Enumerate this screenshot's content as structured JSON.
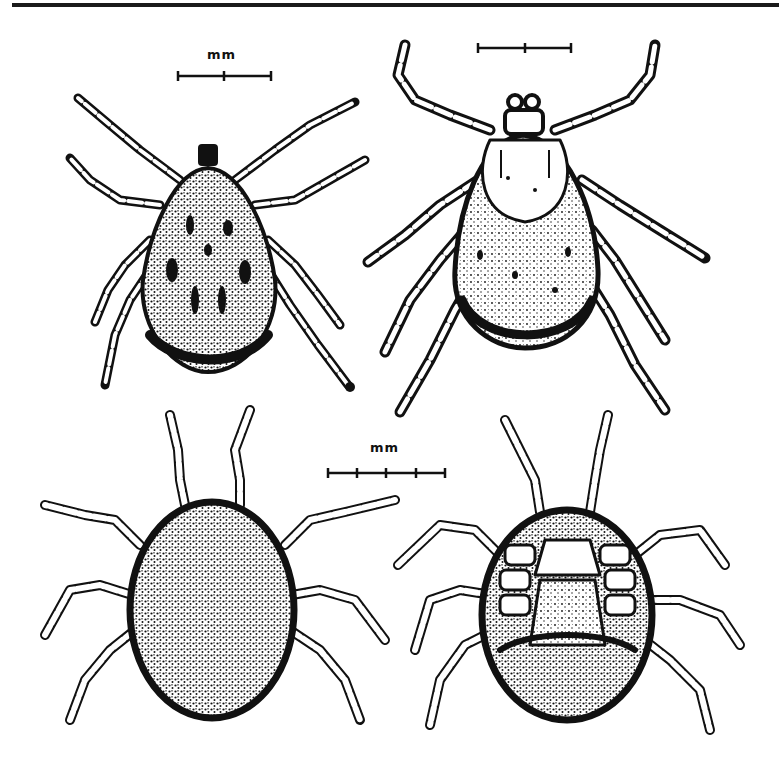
{
  "figure": {
    "type": "scientific-illustration-plate",
    "style": "black ink line drawing on white",
    "colors": {
      "ink": "#111111",
      "paper": "#ffffff",
      "rule": "#1a1a1a"
    },
    "panels": [
      {
        "id": "top-left",
        "subject": "hard tick, dorsal view (male, ornate scutum)",
        "legs": 8
      },
      {
        "id": "top-right",
        "subject": "hard tick, dorsal view (engorged female with scutum)",
        "legs": 8
      },
      {
        "id": "bottom-left",
        "subject": "soft tick, dorsal view (granulated oval body)",
        "legs": 8
      },
      {
        "id": "bottom-right",
        "subject": "soft tick, ventral view (coxae and mouthparts visible)",
        "legs": 8
      }
    ],
    "scale_bars": [
      {
        "id": "scale-top-left",
        "label": "mm",
        "divisions": 2
      },
      {
        "id": "scale-top-right",
        "label": "",
        "divisions": 2
      },
      {
        "id": "scale-bottom",
        "label": "mm",
        "divisions": 4
      }
    ]
  }
}
